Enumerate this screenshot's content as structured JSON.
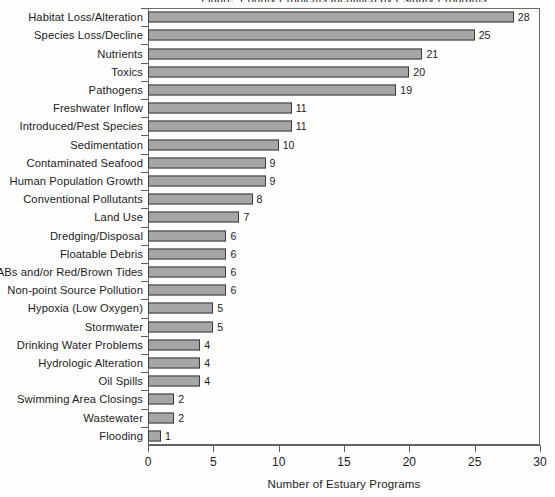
{
  "chart_data": {
    "type": "bar",
    "orientation": "horizontal",
    "title": "",
    "xlabel": "Number of Estuary Programs",
    "ylabel": "",
    "xlim": [
      0,
      30
    ],
    "xticks": [
      0,
      5,
      10,
      15,
      20,
      25,
      30
    ],
    "grid": false,
    "legend": null,
    "bar_color": "#a6a6a6",
    "bar_edge_color": "#3b3b3b",
    "categories": [
      "Habitat Loss/Alteration",
      "Species Loss/Decline",
      "Nutrients",
      "Toxics",
      "Pathogens",
      "Freshwater Inflow",
      "Introduced/Pest Species",
      "Sedimentation",
      "Contaminated Seafood",
      "Human Population Growth",
      "Conventional Pollutants",
      "Land Use",
      "Dredging/Disposal",
      "Floatable Debris",
      "HABs and/or Red/Brown Tides",
      "Non-point Source Pollution",
      "Hypoxia (Low Oxygen)",
      "Stormwater",
      "Drinking Water Problems",
      "Hydrologic Alteration",
      "Oil Spills",
      "Swimming Area Closings",
      "Wastewater",
      "Flooding"
    ],
    "values": [
      28,
      25,
      21,
      20,
      19,
      11,
      11,
      10,
      9,
      9,
      8,
      7,
      6,
      6,
      6,
      6,
      5,
      5,
      4,
      4,
      4,
      2,
      2,
      1
    ],
    "value_labels": [
      "28",
      "25",
      "21",
      "20",
      "19",
      "11",
      "11",
      "10",
      "9",
      "9",
      "8",
      "7",
      "6",
      "6",
      "6",
      "6",
      "5",
      "5",
      "4",
      "4",
      "4",
      "2",
      "2",
      "1"
    ],
    "tick_labels": [
      "0",
      "5",
      "10",
      "15",
      "20",
      "25",
      "30"
    ]
  },
  "axis": {
    "x_title": "Number of Estuary Programs"
  },
  "title_sliver": "Figure: Priority Problems Identified by Estuary Programs"
}
